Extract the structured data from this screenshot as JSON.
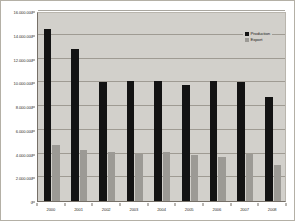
{
  "chart_data": {
    "type": "bar",
    "title": "",
    "xlabel": "",
    "ylabel": "",
    "grid": true,
    "legend_position": "top-right",
    "ylim": [
      0,
      16000000
    ],
    "ytick_values": [
      0,
      2000000,
      4000000,
      6000000,
      8000000,
      10000000,
      12000000,
      14000000,
      16000000
    ],
    "ytick_labels": [
      "0",
      "2.000.000",
      "4.000.000",
      "6.000.000",
      "8.000.000",
      "10.000.000",
      "12.000.000",
      "14.000.000",
      "16.000.000"
    ],
    "categories": [
      "2000",
      "2001",
      "2002",
      "2003",
      "2004",
      "2005",
      "2006",
      "2007",
      "2008"
    ],
    "series": [
      {
        "name": "Production",
        "color": "#131313",
        "values": [
          14500000,
          12800000,
          10050000,
          10100000,
          10100000,
          9800000,
          10100000,
          10000000,
          8800000
        ]
      },
      {
        "name": "Export",
        "color": "#9c9a95",
        "values": [
          4700000,
          4300000,
          4150000,
          4000000,
          4150000,
          3850000,
          3700000,
          4000000,
          3000000
        ]
      }
    ]
  },
  "legend": {
    "items": [
      {
        "label": "Production",
        "color": "#131313"
      },
      {
        "label": "Export",
        "color": "#9c9a95"
      }
    ]
  },
  "colors": {
    "plot_background": "#d2d0cb",
    "page_background": "#ffffff",
    "gridline": "#8e8980",
    "axis": "#767068",
    "frame_border": "#b4b0a6",
    "production": "#131313",
    "export": "#9c9a95"
  }
}
